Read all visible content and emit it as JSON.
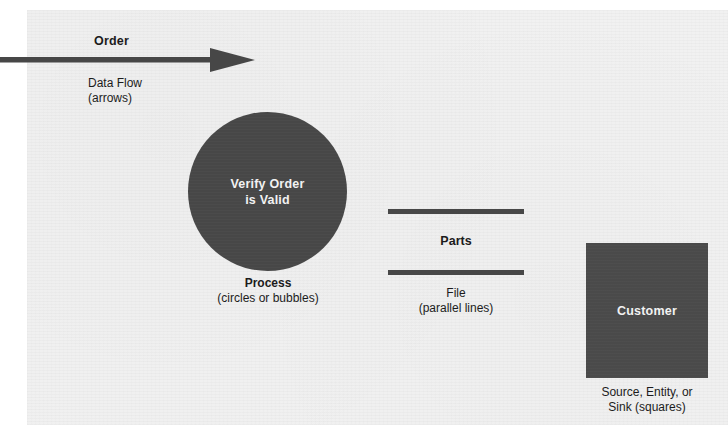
{
  "diagram": {
    "background_color": "#f1f1f1",
    "shape_fill_color": "#474747",
    "shape_text_color": "#f2f2f2",
    "text_color": "#1c1c1c",
    "elements": {
      "data_flow": {
        "icon": "right-arrow",
        "flow_label": "Order",
        "caption_line1": "Data Flow",
        "caption_line2": "(arrows)"
      },
      "process": {
        "icon": "filled-circle",
        "shape_label_line1": "Verify Order",
        "shape_label_line2": "is Valid",
        "caption_line1": "Process",
        "caption_line2": "(circles or bubbles)"
      },
      "file": {
        "icon": "parallel-lines",
        "store_label": "Parts",
        "caption_line1": "File",
        "caption_line2": "(parallel lines)"
      },
      "entity": {
        "icon": "filled-square",
        "shape_label": "Customer",
        "caption_line1": "Source, Entity, or",
        "caption_line2": "Sink (squares)"
      }
    }
  }
}
